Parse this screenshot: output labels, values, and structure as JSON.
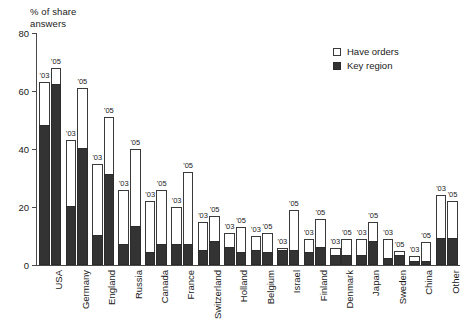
{
  "chart_data": {
    "type": "bar",
    "title": "",
    "ylabel": "% of share answers",
    "xlabel": "",
    "ylim": [
      0,
      80
    ],
    "yticks": [
      0,
      20,
      40,
      60,
      80
    ],
    "grid": false,
    "legend_position": "top-right",
    "stacked": true,
    "series": [
      {
        "name": "Have orders",
        "color": "#ffffff"
      },
      {
        "name": "Key region",
        "color": "#333333"
      }
    ],
    "categories": [
      "USA",
      "Germany",
      "England",
      "Russia",
      "Canada",
      "France",
      "Switzerland",
      "Holland",
      "Belgium",
      "Israel",
      "Finland",
      "Denmark",
      "Japan",
      "Sweden",
      "China",
      "Other"
    ],
    "period_labels": [
      "'03",
      "'05"
    ],
    "points": [
      {
        "category": "USA",
        "year": "'03",
        "total": 63,
        "key_region": 48
      },
      {
        "category": "USA",
        "year": "'05",
        "total": 68,
        "key_region": 62
      },
      {
        "category": "Germany",
        "year": "'03",
        "total": 43,
        "key_region": 20
      },
      {
        "category": "Germany",
        "year": "'05",
        "total": 61,
        "key_region": 40
      },
      {
        "category": "England",
        "year": "'03",
        "total": 35,
        "key_region": 10
      },
      {
        "category": "England",
        "year": "'05",
        "total": 51,
        "key_region": 31
      },
      {
        "category": "Russia",
        "year": "'03",
        "total": 26,
        "key_region": 7
      },
      {
        "category": "Russia",
        "year": "'05",
        "total": 40,
        "key_region": 13
      },
      {
        "category": "Canada",
        "year": "'03",
        "total": 22,
        "key_region": 4
      },
      {
        "category": "Canada",
        "year": "'05",
        "total": 26,
        "key_region": 7
      },
      {
        "category": "France",
        "year": "'03",
        "total": 20,
        "key_region": 7
      },
      {
        "category": "France",
        "year": "'05",
        "total": 32,
        "key_region": 7
      },
      {
        "category": "Switzerland",
        "year": "'03",
        "total": 15,
        "key_region": 5
      },
      {
        "category": "Switzerland",
        "year": "'05",
        "total": 17,
        "key_region": 8
      },
      {
        "category": "Holland",
        "year": "'03",
        "total": 11,
        "key_region": 6
      },
      {
        "category": "Holland",
        "year": "'05",
        "total": 13,
        "key_region": 4
      },
      {
        "category": "Belgium",
        "year": "'03",
        "total": 10,
        "key_region": 5
      },
      {
        "category": "Belgium",
        "year": "'05",
        "total": 11,
        "key_region": 4
      },
      {
        "category": "Israel",
        "year": "'03",
        "total": 6,
        "key_region": 5
      },
      {
        "category": "Israel",
        "year": "'05",
        "total": 19,
        "key_region": 5
      },
      {
        "category": "Finland",
        "year": "'03",
        "total": 9,
        "key_region": 4
      },
      {
        "category": "Finland",
        "year": "'05",
        "total": 16,
        "key_region": 6
      },
      {
        "category": "Denmark",
        "year": "'03",
        "total": 6,
        "key_region": 3
      },
      {
        "category": "Denmark",
        "year": "'05",
        "total": 9,
        "key_region": 3
      },
      {
        "category": "Japan",
        "year": "'03",
        "total": 9,
        "key_region": 3
      },
      {
        "category": "Japan",
        "year": "'05",
        "total": 15,
        "key_region": 8
      },
      {
        "category": "Sweden",
        "year": "'03",
        "total": 9,
        "key_region": 2
      },
      {
        "category": "Sweden",
        "year": "'05",
        "total": 5,
        "key_region": 3
      },
      {
        "category": "China",
        "year": "'03",
        "total": 3,
        "key_region": 1
      },
      {
        "category": "China",
        "year": "'05",
        "total": 8,
        "key_region": 1
      },
      {
        "category": "Other",
        "year": "'03",
        "total": 24,
        "key_region": 9
      },
      {
        "category": "Other",
        "year": "'05",
        "total": 22,
        "key_region": 9
      }
    ]
  },
  "axis": {
    "y_title": "% of share\nanswers",
    "y_tick_labels": [
      "0",
      "20",
      "40",
      "60",
      "80"
    ]
  },
  "legend": {
    "items": [
      {
        "label": "Have orders",
        "style": "open"
      },
      {
        "label": "Key region",
        "style": "filled"
      }
    ]
  }
}
